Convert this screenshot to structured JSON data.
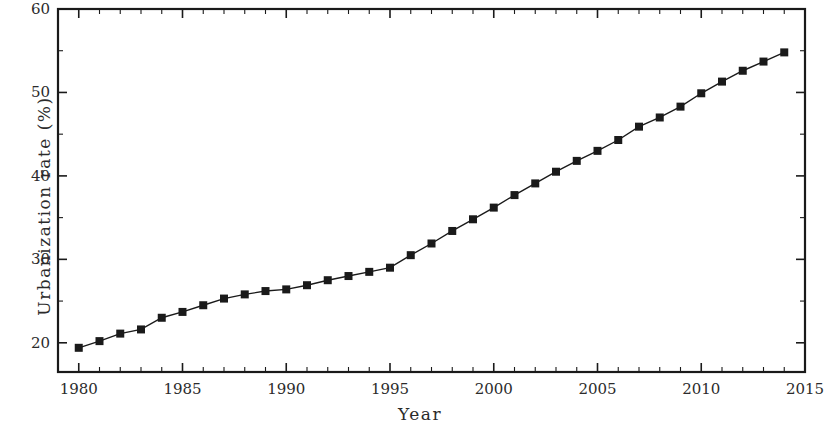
{
  "chart_data": {
    "type": "line",
    "title": "",
    "subtitle": "",
    "xlabel": "Year",
    "ylabel": "Urbanization rate (%)",
    "xlim": [
      1979,
      2015
    ],
    "ylim": [
      16.5,
      60
    ],
    "grid": false,
    "legend": null,
    "marker": "filled-square",
    "line_color": "#1a1a1a",
    "marker_color": "#1a1a1a",
    "background_color": "#ffffff",
    "x_major_ticks": [
      1980,
      1985,
      1990,
      1995,
      2000,
      2005,
      2010,
      2015
    ],
    "x_major_tick_labels": [
      "1980",
      "1985",
      "1990",
      "1995",
      "2000",
      "2005",
      "2010",
      "2015"
    ],
    "x_minor_tick_step": 1,
    "y_major_ticks": [
      20,
      30,
      40,
      50,
      60
    ],
    "y_major_tick_labels": [
      "20",
      "30",
      "40",
      "50",
      "60"
    ],
    "y_minor_tick_step": 5,
    "tick_direction": "in",
    "x": [
      1980,
      1981,
      1982,
      1983,
      1984,
      1985,
      1986,
      1987,
      1988,
      1989,
      1990,
      1991,
      1992,
      1993,
      1994,
      1995,
      1996,
      1997,
      1998,
      1999,
      2000,
      2001,
      2002,
      2003,
      2004,
      2005,
      2006,
      2007,
      2008,
      2009,
      2010,
      2011,
      2012,
      2013,
      2014
    ],
    "values": [
      19.4,
      20.2,
      21.1,
      21.6,
      23.0,
      23.7,
      24.5,
      25.3,
      25.8,
      26.2,
      26.4,
      26.9,
      27.5,
      28.0,
      28.5,
      29.0,
      30.5,
      31.9,
      33.4,
      34.8,
      36.2,
      37.7,
      39.1,
      40.5,
      41.8,
      43.0,
      44.3,
      45.9,
      47.0,
      48.3,
      49.9,
      51.3,
      52.6,
      53.7,
      54.8
    ]
  },
  "axis": {
    "x_title": "Year",
    "y_title": "Urbanization rate (%)"
  }
}
